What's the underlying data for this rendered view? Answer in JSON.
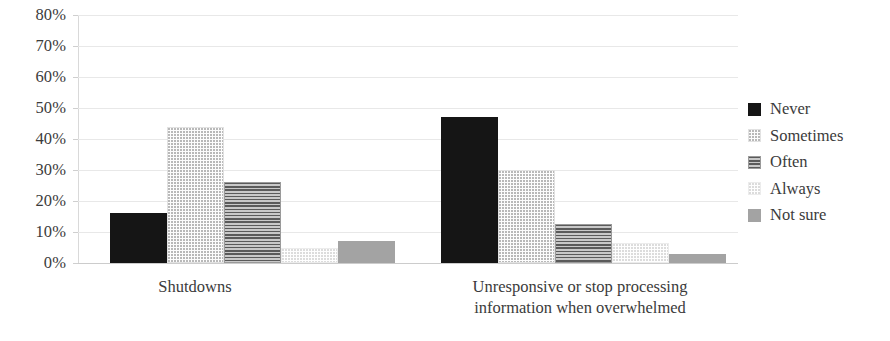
{
  "chart_data": {
    "type": "bar",
    "title": "",
    "subtitle": "",
    "xlabel": "",
    "ylabel": "",
    "ylim": [
      0,
      80
    ],
    "y_tick_labels": [
      "80%",
      "70%",
      "60%",
      "50%",
      "40%",
      "30%",
      "20%",
      "10%",
      "0%"
    ],
    "y_ticks": [
      80,
      70,
      60,
      50,
      40,
      30,
      20,
      10,
      0
    ],
    "grid": true,
    "legend_position": "right",
    "categories": [
      "Shutdowns",
      "Unresponsive or stop processing information when overwhelmed"
    ],
    "category_label_lines": [
      [
        "Shutdowns"
      ],
      [
        "Unresponsive or stop processing",
        "information when overwhelmed"
      ]
    ],
    "series": [
      {
        "name": "Never",
        "pattern": "solid-black",
        "color": "#151515",
        "values": [
          16,
          47
        ]
      },
      {
        "name": "Sometimes",
        "pattern": "fine-dots-light",
        "color": "#fdfdfd",
        "values": [
          44,
          30
        ]
      },
      {
        "name": "Often",
        "pattern": "horizontal-lines",
        "color": "#8f8f8f",
        "values": [
          26,
          12.5
        ]
      },
      {
        "name": "Always",
        "pattern": "sparse-dots-faint",
        "color": "#fefefe",
        "values": [
          5,
          6.5
        ]
      },
      {
        "name": "Not sure",
        "pattern": "solid-gray",
        "color": "#a3a3a3",
        "values": [
          7,
          3
        ]
      }
    ]
  },
  "legend": {
    "items": [
      {
        "label": "Never"
      },
      {
        "label": "Sometimes"
      },
      {
        "label": "Often"
      },
      {
        "label": "Always"
      },
      {
        "label": "Not sure"
      }
    ]
  },
  "axes": {
    "y": {
      "ticks": [
        {
          "label": "80%"
        },
        {
          "label": "70%"
        },
        {
          "label": "60%"
        },
        {
          "label": "50%"
        },
        {
          "label": "40%"
        },
        {
          "label": "30%"
        },
        {
          "label": "20%"
        },
        {
          "label": "10%"
        },
        {
          "label": "0%"
        }
      ]
    },
    "x": {
      "categories": [
        {
          "line1": "Shutdowns",
          "line2": ""
        },
        {
          "line1": "Unresponsive or stop processing",
          "line2": "information when overwhelmed"
        }
      ]
    }
  }
}
